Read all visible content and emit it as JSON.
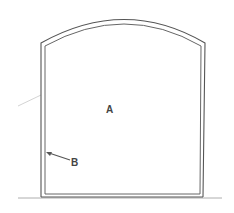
{
  "diagram": {
    "type": "cross-section",
    "shape": "arched-top rectangular enclosure with double-line wall",
    "labels": {
      "interior": "A",
      "wall": "B"
    },
    "colors": {
      "line": "#555555",
      "line_light": "#9a9a9a",
      "background": "#ffffff"
    }
  }
}
